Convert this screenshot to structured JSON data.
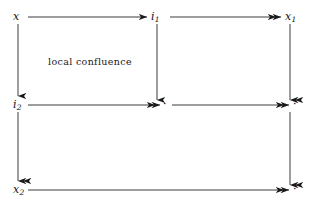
{
  "diagram": {
    "type": "commutative-diagram",
    "background_color": "#ffffff",
    "stroke_color": "#1a1a1a",
    "annotation": {
      "text": "local confluence"
    },
    "nodes": {
      "top_left": {
        "base": "x",
        "sub": "",
        "x": 14,
        "y": 12
      },
      "top_middle": {
        "base": "i",
        "sub": "1",
        "x": 152,
        "y": 12
      },
      "top_right": {
        "base": "x",
        "sub": "1",
        "x": 285,
        "y": 12
      },
      "mid_left": {
        "base": "i",
        "sub": "2",
        "x": 14,
        "y": 100
      },
      "mid_middle": {
        "base": "·",
        "sub": "",
        "x": 163,
        "y": 100
      },
      "mid_right": {
        "base": "·",
        "sub": "",
        "x": 292,
        "y": 100
      },
      "bottom_left": {
        "base": "x",
        "sub": "2",
        "x": 14,
        "y": 184
      },
      "bottom_right": {
        "base": "·",
        "sub": "",
        "x": 292,
        "y": 184
      }
    },
    "arrows": [
      {
        "id": "x-to-i1",
        "from": "top_left",
        "to": "top_middle",
        "head": "single",
        "direction": "right"
      },
      {
        "id": "i1-to-x1",
        "from": "top_middle",
        "to": "top_right",
        "head": "double",
        "direction": "right"
      },
      {
        "id": "i2-to-mid",
        "from": "mid_left",
        "to": "mid_middle",
        "head": "double",
        "direction": "right"
      },
      {
        "id": "mid-to-right",
        "from": "mid_middle",
        "to": "mid_right",
        "head": "double",
        "direction": "right"
      },
      {
        "id": "x2-to-bottom",
        "from": "bottom_left",
        "to": "bottom_right",
        "head": "double",
        "direction": "right"
      },
      {
        "id": "x-to-i2",
        "from": "top_left",
        "to": "mid_left",
        "head": "single",
        "direction": "down"
      },
      {
        "id": "i2-to-x2",
        "from": "mid_left",
        "to": "bottom_left",
        "head": "double",
        "direction": "down"
      },
      {
        "id": "i1-to-mid",
        "from": "top_middle",
        "to": "mid_middle",
        "head": "single",
        "direction": "down"
      },
      {
        "id": "x1-to-mid",
        "from": "top_right",
        "to": "mid_right",
        "head": "double",
        "direction": "down"
      },
      {
        "id": "mid-to-bot",
        "from": "mid_right",
        "to": "bottom_right",
        "head": "double",
        "direction": "down"
      }
    ]
  }
}
